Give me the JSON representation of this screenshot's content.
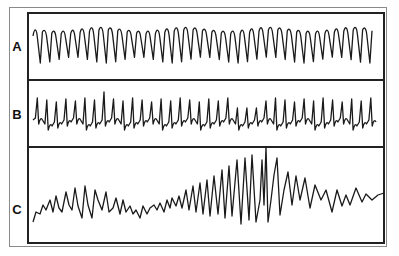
{
  "figure": {
    "panels": [
      {
        "id": "A",
        "label": "A",
        "description": "Regular sinusoidal high-frequency waveform (sine-wave like oscillation)"
      },
      {
        "id": "B",
        "label": "B",
        "description": "Irregular spiky waveform with sharp upward deflections"
      },
      {
        "id": "C",
        "label": "C",
        "description": "Waveform with increasing then varying amplitude spikes, peaking mid-right with a tall spike"
      }
    ],
    "colors": {
      "trace": "#1a1a1a",
      "frame": "#222222",
      "outer_frame": "#8a8a8a",
      "background": "#ffffff"
    }
  }
}
